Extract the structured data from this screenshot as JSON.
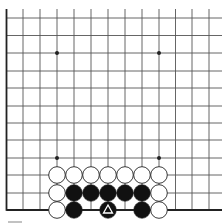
{
  "board": {
    "cols_x": [
      6.5,
      23,
      40,
      57,
      74,
      91,
      108,
      125,
      142,
      159,
      175.5,
      192,
      209
    ],
    "rows_y": [
      18,
      35.5,
      53,
      71,
      88,
      106,
      123,
      140,
      158,
      175,
      193,
      210
    ],
    "right_extent": 222,
    "top_extent": 9,
    "edges": [
      "left",
      "bottom"
    ],
    "line_color": "#555555",
    "edge_color": "#222222",
    "star_points": [
      [
        57,
        53
      ],
      [
        159,
        53
      ],
      [
        57,
        158
      ],
      [
        159,
        158
      ]
    ],
    "stone_radius": 8.3
  },
  "stones": [
    {
      "color": "white",
      "x": 57,
      "y": 175
    },
    {
      "color": "white",
      "x": 74,
      "y": 175
    },
    {
      "color": "white",
      "x": 91,
      "y": 175
    },
    {
      "color": "white",
      "x": 108,
      "y": 175
    },
    {
      "color": "white",
      "x": 125,
      "y": 175
    },
    {
      "color": "white",
      "x": 142,
      "y": 175
    },
    {
      "color": "white",
      "x": 159,
      "y": 175
    },
    {
      "color": "white",
      "x": 57,
      "y": 193
    },
    {
      "color": "black",
      "x": 74,
      "y": 193
    },
    {
      "color": "black",
      "x": 91,
      "y": 193
    },
    {
      "color": "black",
      "x": 108,
      "y": 193
    },
    {
      "color": "black",
      "x": 125,
      "y": 193
    },
    {
      "color": "black",
      "x": 142,
      "y": 193
    },
    {
      "color": "white",
      "x": 159,
      "y": 193
    },
    {
      "color": "white",
      "x": 57,
      "y": 210
    },
    {
      "color": "black",
      "x": 74,
      "y": 210
    },
    {
      "color": "black",
      "x": 108,
      "y": 210,
      "marker": "triangle"
    },
    {
      "color": "black",
      "x": 142,
      "y": 210
    },
    {
      "color": "white",
      "x": 159,
      "y": 210
    }
  ]
}
